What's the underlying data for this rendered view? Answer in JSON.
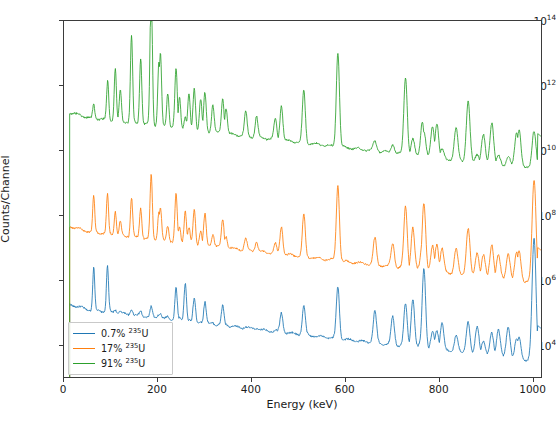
{
  "chart_data": {
    "type": "line",
    "title": "",
    "xlabel": "Energy (keV)",
    "ylabel": "Counts/Channel",
    "xlim": [
      0,
      1020
    ],
    "ylim": [
      1000,
      100000000000000
    ],
    "yscale": "log",
    "xticks": [
      "0",
      "200",
      "400",
      "600",
      "800",
      "1000"
    ],
    "xtick_values": [
      0,
      200,
      400,
      600,
      800,
      1000
    ],
    "yticks": [
      "10^4",
      "10^6",
      "10^8",
      "10^10",
      "10^12",
      "10^14"
    ],
    "ytick_exponents": [
      4,
      6,
      8,
      10,
      12,
      14
    ],
    "grid": false,
    "legend_position": "lower left",
    "series": [
      {
        "name": "0.7% 235U",
        "label_pct": "0.7%",
        "label_iso": "235",
        "label_el": "U",
        "color": "#1f77b4",
        "baseline_exp": 5.0
      },
      {
        "name": "17% 235U",
        "label_pct": "17%",
        "label_iso": "235",
        "label_el": "U",
        "color": "#ff7f0e",
        "baseline_exp": 7.4
      },
      {
        "name": "91% 235U",
        "label_pct": "91%",
        "label_iso": "235",
        "label_el": "U",
        "color": "#2ca02c",
        "baseline_exp": 10.9
      }
    ],
    "annotations": [
      {
        "isotope": "235",
        "element": "U",
        "energy": "143.8",
        "text": "235U (143.8)",
        "x_keV": 143.8,
        "label_x_px": 113,
        "label_y_px": 55,
        "line_top_px": 66,
        "line_height_px": 36
      },
      {
        "isotope": "235",
        "element": "U",
        "energy": "185.7",
        "text": "235U (185.7)",
        "x_keV": 185.7,
        "label_x_px": 175,
        "label_y_px": 28,
        "line_top_px": 39,
        "line_height_px": 22
      },
      {
        "isotope": "228",
        "element": "Th",
        "energy": "583.2",
        "text": "228Th (583.2)",
        "x_keV": 583.2,
        "label_x_px": 355,
        "label_y_px": 45,
        "line_top_px": 57,
        "line_height_px": 85
      },
      {
        "isotope": "228",
        "element": "Th",
        "energy": "727.3",
        "text": "228Th (727.3)",
        "x_keV": 727.3,
        "label_x_px": 420,
        "label_y_px": 70,
        "line_top_px": 82,
        "line_height_px": 78
      },
      {
        "isotope": "238",
        "element": "U",
        "energy": "766.4",
        "text": "238U (766.4)",
        "x_keV": 766.4,
        "label_x_px": 435,
        "label_y_px": 88,
        "line_top_px": 100,
        "line_height_px": 64
      },
      {
        "isotope": "228",
        "element": "Th",
        "energy": "860.6",
        "text": "228Th (860.6)",
        "x_keV": 860.6,
        "label_x_px": 480,
        "label_y_px": 122,
        "line_top_px": 134,
        "line_height_px": 34
      },
      {
        "isotope": "238",
        "element": "U",
        "energy": "1001",
        "text": "238U (1001)",
        "x_keV": 1001,
        "label_x_px": 515,
        "label_y_px": 45,
        "line_top_px": 57,
        "line_height_px": 98
      }
    ],
    "peaks_235U": [
      143.8,
      185.7,
      163.3,
      205.3,
      109.2,
      202.1
    ],
    "peaks_238U": [
      766.4,
      1001,
      258.3,
      742.8
    ],
    "peaks_228Th": [
      583.2,
      727.3,
      860.6,
      510.7,
      277.4,
      300.1
    ]
  },
  "colors": {
    "blue": "#1f77b4",
    "orange": "#ff7f0e",
    "green": "#2ca02c",
    "axis": "#3b3b3b",
    "background": "#ffffff"
  }
}
